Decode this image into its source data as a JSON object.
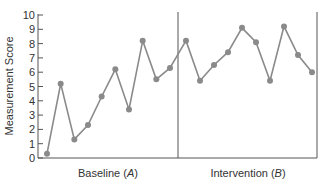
{
  "chart_data": {
    "type": "line",
    "title": "",
    "xlabel": "",
    "ylabel": "Measurement Score",
    "ylim": [
      0,
      10
    ],
    "yticks": [
      0,
      1,
      2,
      3,
      4,
      5,
      6,
      7,
      8,
      9,
      10
    ],
    "grid": false,
    "legend": null,
    "phases": [
      {
        "label": "Baseline",
        "letter": "A",
        "values": [
          0.3,
          5.2,
          1.3,
          2.3,
          4.3,
          6.2,
          3.4,
          8.2,
          5.5,
          6.3
        ]
      },
      {
        "label": "Intervention",
        "letter": "B",
        "values": [
          8.2,
          5.4,
          6.5,
          7.4,
          9.1,
          8.1,
          5.4,
          9.2,
          7.2,
          6.0
        ]
      }
    ],
    "series": [
      {
        "name": "Measurement Score",
        "values": [
          0.3,
          5.2,
          1.3,
          2.3,
          4.3,
          6.2,
          3.4,
          8.2,
          5.5,
          6.3,
          8.2,
          5.4,
          6.5,
          7.4,
          9.1,
          8.1,
          5.4,
          9.2,
          7.2,
          6.0
        ]
      }
    ],
    "colors": {
      "line": "#8a8a8a",
      "marker": "#8a8a8a",
      "axis": "#555555"
    }
  },
  "labels": {
    "ylabel": "Measurement Score",
    "baseline": "Baseline (",
    "baseline_letter": "A",
    "baseline_close": ")",
    "intervention": "Intervention (",
    "intervention_letter": "B",
    "intervention_close": ")"
  }
}
